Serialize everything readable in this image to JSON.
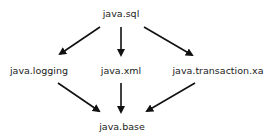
{
  "diagram": {
    "type": "module-dependency-graph",
    "nodes": [
      {
        "id": "sql",
        "label": "java.sql",
        "x": 121,
        "y": 8
      },
      {
        "id": "logging",
        "label": "java.logging",
        "x": 39,
        "y": 65
      },
      {
        "id": "xml",
        "label": "java.xml",
        "x": 121,
        "y": 65
      },
      {
        "id": "xa",
        "label": "java.transaction.xa",
        "x": 218,
        "y": 65
      },
      {
        "id": "base",
        "label": "java.base",
        "x": 122,
        "y": 121
      }
    ],
    "edges": [
      {
        "from": "java.sql",
        "to": "java.logging"
      },
      {
        "from": "java.sql",
        "to": "java.xml"
      },
      {
        "from": "java.sql",
        "to": "java.transaction.xa"
      },
      {
        "from": "java.logging",
        "to": "java.base"
      },
      {
        "from": "java.xml",
        "to": "java.base"
      },
      {
        "from": "java.transaction.xa",
        "to": "java.base"
      }
    ]
  }
}
